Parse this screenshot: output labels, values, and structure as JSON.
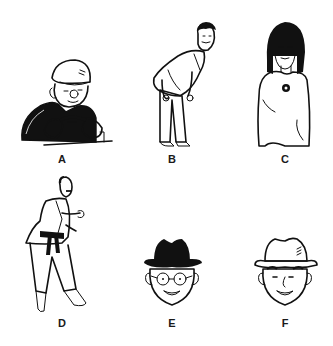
{
  "figures": [
    {
      "id": "A",
      "label": "A",
      "description": "man in flat cap at wheel"
    },
    {
      "id": "B",
      "label": "B",
      "description": "tall man in grey suit bending forward"
    },
    {
      "id": "C",
      "label": "C",
      "description": "woman with long black hair"
    },
    {
      "id": "D",
      "label": "D",
      "description": "martial artist in gi with black belt"
    },
    {
      "id": "E",
      "label": "E",
      "description": "face with glasses and black fedora"
    },
    {
      "id": "F",
      "label": "F",
      "description": "face with white fedora"
    }
  ],
  "colors": {
    "background": "#ffffff",
    "ink": "#111111",
    "suit_grey": "#bdbdbd",
    "label": "#1a1a1a"
  }
}
